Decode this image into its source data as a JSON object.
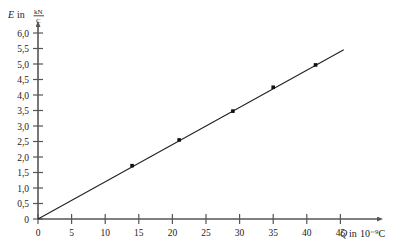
{
  "chart_data": {
    "type": "scatter",
    "title": "",
    "xlabel": "Q in 10⁻⁹C",
    "ylabel": "E in kN/C",
    "ylabel_symbol": "E",
    "ylabel_in": "in",
    "ylabel_unit_numerator": "kN",
    "ylabel_unit_denominator": "C",
    "xlabel_symbol": "Q",
    "xlabel_in": "in",
    "xlabel_unit": "10⁻⁹C",
    "xlim": [
      0,
      49.5
    ],
    "ylim": [
      0,
      6.2
    ],
    "xticks": [
      0,
      5,
      10,
      15,
      20,
      25,
      30,
      35,
      40,
      45
    ],
    "xtick_labels": [
      "0",
      "5",
      "10",
      "15",
      "20",
      "25",
      "30",
      "35",
      "40",
      "45"
    ],
    "yticks": [
      0,
      0.5,
      1.0,
      1.5,
      2.0,
      2.5,
      3.0,
      3.5,
      4.0,
      4.5,
      5.0,
      5.5,
      6.0
    ],
    "ytick_labels": [
      "0",
      "0,5",
      "1,0",
      "1,5",
      "2,0",
      "2,5",
      "3,0",
      "3,5",
      "4,0",
      "4,5",
      "5,0",
      "5,5",
      "6,0"
    ],
    "grid": false,
    "legend": "none",
    "x": [
      14.0,
      21.0,
      29.0,
      35.0,
      41.3
    ],
    "y": [
      1.72,
      2.55,
      3.48,
      4.25,
      4.97
    ],
    "points": [
      {
        "x": 14.0,
        "y": 1.72
      },
      {
        "x": 21.0,
        "y": 2.55
      },
      {
        "x": 29.0,
        "y": 3.48
      },
      {
        "x": 35.0,
        "y": 4.25
      },
      {
        "x": 41.3,
        "y": 4.97
      }
    ],
    "fit_line": {
      "name": "best-fit line through origin",
      "x_start": 0,
      "y_start": 0,
      "x_end": 45.5,
      "y_end": 5.46,
      "slope": 0.12
    },
    "axis_arrows": true,
    "decimal_separator": ","
  }
}
